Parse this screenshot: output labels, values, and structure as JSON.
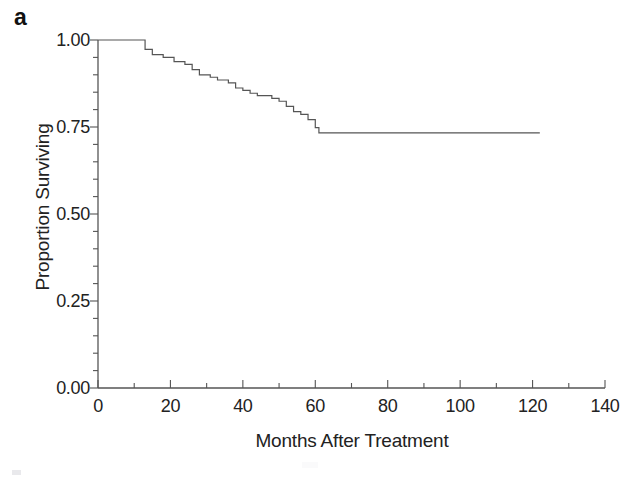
{
  "figure": {
    "panel_label": "a",
    "background_color": "#ffffff",
    "line_color": "#555555"
  },
  "chart_data": {
    "type": "line",
    "title": "",
    "subtitle": "",
    "xlabel": "Months After Treatment",
    "ylabel": "Proportion Surviving",
    "xlim": [
      0,
      140
    ],
    "ylim": [
      0.0,
      1.0
    ],
    "xticks": [
      0,
      20,
      40,
      60,
      80,
      100,
      120,
      140
    ],
    "xtick_labels": [
      "0",
      "20",
      "40",
      "60",
      "80",
      "100",
      "120",
      "140"
    ],
    "yticks": [
      0.0,
      0.25,
      0.5,
      0.75,
      1.0
    ],
    "ytick_labels": [
      "0.00",
      "0.25",
      "0.50",
      "0.75",
      "1.00"
    ],
    "minor_tick_step_y": 0.05,
    "minor_tick_step_x": 10,
    "grid": false,
    "legend": null,
    "legend_position": "none",
    "curve_style": "step-post",
    "series": [
      {
        "name": "Kaplan-Meier survival",
        "x": [
          0,
          11,
          13,
          15,
          18,
          21,
          24,
          26,
          28,
          31,
          33,
          36,
          38,
          40,
          42,
          44,
          46,
          48,
          50,
          52,
          54,
          56,
          58,
          60,
          61,
          122
        ],
        "values": [
          1.0,
          1.0,
          0.973,
          0.958,
          0.95,
          0.938,
          0.93,
          0.915,
          0.9,
          0.893,
          0.885,
          0.877,
          0.862,
          0.855,
          0.847,
          0.84,
          0.84,
          0.832,
          0.824,
          0.809,
          0.794,
          0.786,
          0.771,
          0.748,
          0.733,
          0.733
        ]
      }
    ],
    "annotations": [
      {
        "text": "plateau",
        "value": 0.73,
        "x_start": 61,
        "x_end": 122
      }
    ]
  }
}
